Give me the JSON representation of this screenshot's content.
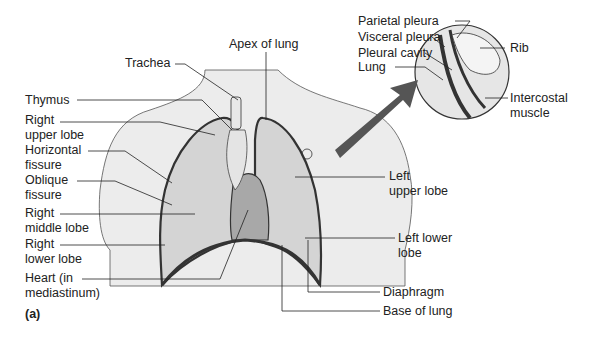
{
  "figure": {
    "panel_label": "(a)",
    "labels": {
      "apex": "Apex of lung",
      "trachea": "Trachea",
      "thymus": "Thymus",
      "right_upper_lobe_1": "Right",
      "right_upper_lobe_2": "upper lobe",
      "horizontal_fissure_1": "Horizontal",
      "horizontal_fissure_2": "fissure",
      "oblique_fissure_1": "Oblique",
      "oblique_fissure_2": "fissure",
      "right_middle_lobe_1": "Right",
      "right_middle_lobe_2": "middle lobe",
      "right_lower_lobe_1": "Right",
      "right_lower_lobe_2": "lower lobe",
      "heart_1": "Heart (in",
      "heart_2": "mediastinum)",
      "parietal_pleura": "Parietal pleura",
      "visceral_pleura": "Visceral pleura",
      "pleural_cavity": "Pleural cavity",
      "lung": "Lung",
      "rib": "Rib",
      "intercostal_1": "Intercostal",
      "intercostal_2": "muscle",
      "left_upper_lobe_1": "Left",
      "left_upper_lobe_2": "upper lobe",
      "left_lower_lobe_1": "Left lower",
      "left_lower_lobe_2": "lobe",
      "diaphragm": "Diaphragm",
      "base_of_lung": "Base of lung"
    },
    "colors": {
      "body": "#ececec",
      "lung": "#d4d4d4",
      "heart": "#a8a8a8",
      "outline": "#333333"
    }
  }
}
